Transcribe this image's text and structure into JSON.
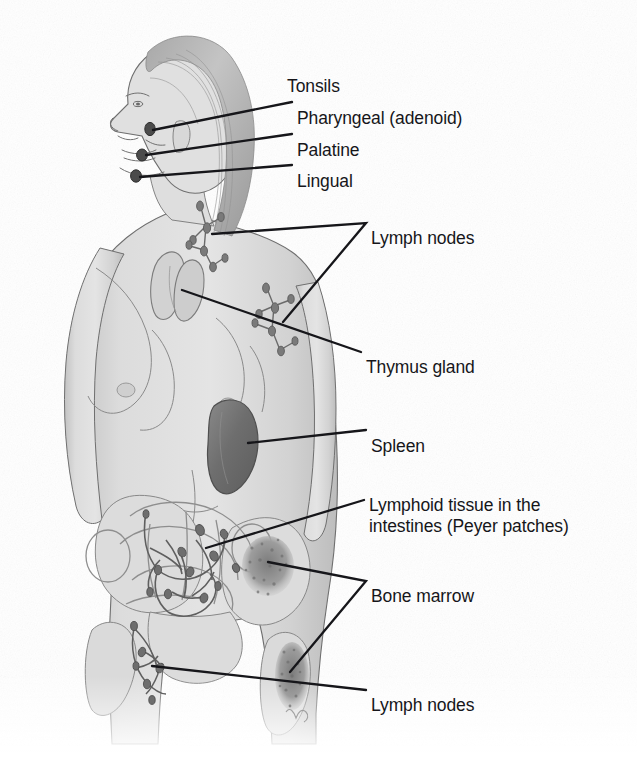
{
  "figure": {
    "style": "grayscale pencil medical illustration",
    "background_color": "#ffffff",
    "ink_color": "#16161a",
    "skin_tone": "#d9d9d9",
    "organ_dark": "#6e6e6e",
    "marrow_tone": "#8f8f8f"
  },
  "labels": [
    {
      "id": "tonsils",
      "text": "Tonsils",
      "x": 287,
      "y": 76,
      "leader": "none",
      "role": "group-heading"
    },
    {
      "id": "pharyngeal",
      "text": "Pharyngeal (adenoid)",
      "x": 297,
      "y": 108,
      "leader": "line",
      "target": "nasopharynx"
    },
    {
      "id": "palatine",
      "text": "Palatine",
      "x": 297,
      "y": 140,
      "leader": "line",
      "target": "oropharynx"
    },
    {
      "id": "lingual",
      "text": "Lingual",
      "x": 297,
      "y": 171,
      "leader": "line",
      "target": "tongue-base"
    },
    {
      "id": "lymph-nodes-upper",
      "text": "Lymph nodes",
      "x": 371,
      "y": 228,
      "leader": "fork",
      "target": "cervical and axillary chains"
    },
    {
      "id": "thymus-gland",
      "text": "Thymus gland",
      "x": 366,
      "y": 357,
      "leader": "line",
      "target": "thymus"
    },
    {
      "id": "spleen",
      "text": "Spleen",
      "x": 371,
      "y": 436,
      "leader": "line",
      "target": "spleen"
    },
    {
      "id": "peyer-patches",
      "text": "Lymphoid tissue in the intestines (Peyer patches)",
      "line1": "Lymphoid tissue in the",
      "line2": "intestines (Peyer patches)",
      "x": 369,
      "y": 495,
      "leader": "line",
      "target": "mesenteric lymphatics"
    },
    {
      "id": "bone-marrow",
      "text": "Bone marrow",
      "x": 371,
      "y": 586,
      "leader": "fork",
      "target": "iliac crest and proximal femur"
    },
    {
      "id": "lymph-nodes-lower",
      "text": "Lymph nodes",
      "x": 371,
      "y": 695,
      "leader": "line",
      "target": "inguinal chain"
    }
  ],
  "anatomy": [
    {
      "id": "pharyngeal-tonsil",
      "name": "pharyngeal tonsil marker",
      "cx": 150,
      "cy": 129
    },
    {
      "id": "palatine-tonsil",
      "name": "palatine tonsil marker",
      "cx": 142,
      "cy": 155
    },
    {
      "id": "lingual-tonsil",
      "name": "lingual tonsil marker",
      "cx": 136,
      "cy": 176
    },
    {
      "id": "cervical-nodes",
      "name": "cervical lymph node chain",
      "cx": 207,
      "cy": 232
    },
    {
      "id": "axillary-nodes",
      "name": "axillary lymph node chain",
      "cx": 276,
      "cy": 310
    },
    {
      "id": "thymus",
      "name": "thymus gland",
      "cx": 175,
      "cy": 290
    },
    {
      "id": "spleen",
      "name": "spleen",
      "cx": 233,
      "cy": 443
    },
    {
      "id": "mesenteric",
      "name": "mesenteric lymphatic network",
      "cx": 180,
      "cy": 575
    },
    {
      "id": "iliac-marrow",
      "name": "iliac crest bone marrow",
      "cx": 268,
      "cy": 567
    },
    {
      "id": "femur-marrow",
      "name": "proximal femur bone marrow",
      "cx": 293,
      "cy": 672
    },
    {
      "id": "inguinal-nodes",
      "name": "inguinal lymph node chain",
      "cx": 147,
      "cy": 662
    }
  ]
}
